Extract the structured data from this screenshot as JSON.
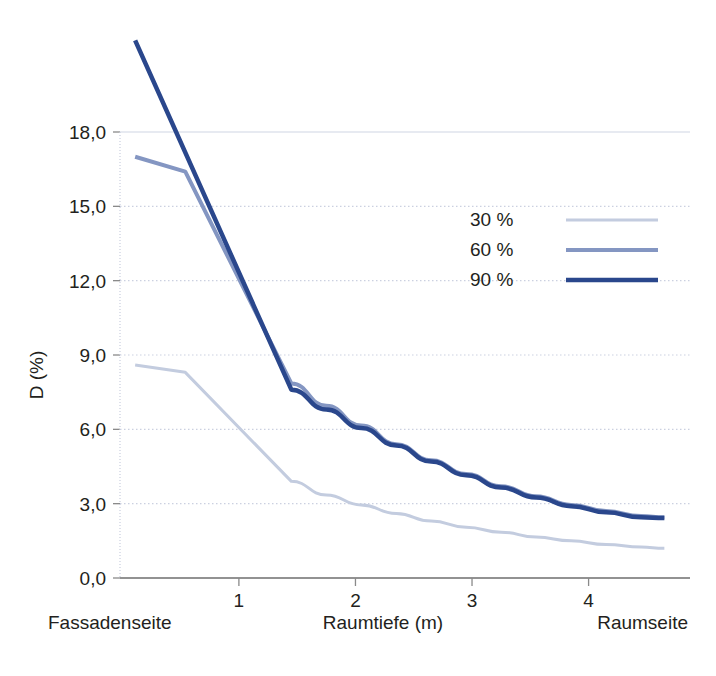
{
  "chart_data": {
    "type": "line",
    "title": "",
    "xlabel": "Raumtiefe (m)",
    "ylabel": "D (%)",
    "xlim": [
      -0.02,
      4.87
    ],
    "ylim": [
      0,
      22.5
    ],
    "grid": true,
    "grid_axis": "y",
    "legend_position": "inside-upper-right",
    "x_ticks": [
      1,
      2,
      3,
      4
    ],
    "x_tick_labels": [
      "1",
      "2",
      "3",
      "4"
    ],
    "y_ticks": [
      0,
      3,
      6,
      9,
      12,
      15,
      18
    ],
    "y_tick_labels": [
      "0,0",
      "3,0",
      "6,0",
      "9,0",
      "12,0",
      "15,0",
      "18,0"
    ],
    "x_axis_left_caption": "Fassadenseite",
    "x_axis_center_caption": "Raumtiefe (m)",
    "x_axis_right_caption": "Raumseite",
    "series": [
      {
        "name": "30 %",
        "color": "#c3ccdf",
        "width": 3,
        "x": [
          0.11,
          0.54,
          1.45,
          1.75,
          2.05,
          2.35,
          2.65,
          2.95,
          3.25,
          3.55,
          3.85,
          4.15,
          4.45,
          4.65
        ],
        "values": [
          8.6,
          8.3,
          3.9,
          3.35,
          2.95,
          2.6,
          2.3,
          2.05,
          1.85,
          1.65,
          1.5,
          1.35,
          1.25,
          1.2
        ]
      },
      {
        "name": "60 %",
        "color": "#8496c2",
        "width": 4,
        "x": [
          0.11,
          0.54,
          1.45,
          1.75,
          2.05,
          2.35,
          2.65,
          2.95,
          3.25,
          3.55,
          3.85,
          4.15,
          4.45,
          4.65
        ],
        "values": [
          17.0,
          16.4,
          7.85,
          6.95,
          6.15,
          5.4,
          4.75,
          4.2,
          3.7,
          3.3,
          2.95,
          2.7,
          2.5,
          2.45
        ]
      },
      {
        "name": "90 %",
        "color": "#2a478c",
        "width": 4.5,
        "x": [
          0.11,
          1.45,
          1.75,
          2.05,
          2.35,
          2.65,
          2.95,
          3.25,
          3.55,
          3.85,
          4.15,
          4.45,
          4.65
        ],
        "values": [
          21.7,
          7.6,
          6.8,
          6.05,
          5.35,
          4.7,
          4.15,
          3.65,
          3.25,
          2.9,
          2.65,
          2.45,
          2.42
        ]
      }
    ],
    "legend": [
      {
        "label": "30 %",
        "color": "#c3ccdf",
        "width": 3
      },
      {
        "label": "60 %",
        "color": "#8496c2",
        "width": 4
      },
      {
        "label": "90 %",
        "color": "#2a478c",
        "width": 4.5
      }
    ],
    "colors": {
      "background": "#ffffff",
      "gridline": "#c8cede",
      "axis": "#6e6e6e",
      "text": "#231f20"
    }
  }
}
